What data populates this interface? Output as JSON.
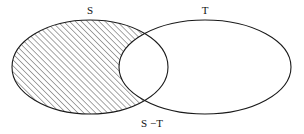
{
  "figure": {
    "kind": "venn-diagram",
    "background_color": "#ffffff",
    "stroke_color": "#1a1a1a",
    "hatch_color": "#444444",
    "label_color": "#111111",
    "width": 304,
    "height": 134
  },
  "sets": {
    "left": {
      "label": "S",
      "label_x": 90,
      "label_y": 11,
      "center_x": 90,
      "center_y": 67,
      "radius_x": 78,
      "radius_y": 47
    },
    "right": {
      "label": "T",
      "label_x": 205,
      "label_y": 11,
      "center_x": 205,
      "center_y": 67,
      "radius_x": 86,
      "radius_y": 47
    }
  },
  "shaded_region": {
    "label": "S −T",
    "label_x": 152,
    "label_y": 124,
    "description": "set difference S minus T",
    "fill_style": "diagonal-hatch",
    "hatch_angle_degrees": 45,
    "hatch_spacing_px": 3
  }
}
